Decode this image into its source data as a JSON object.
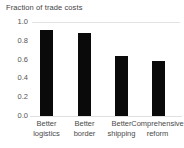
{
  "chart_data": {
    "type": "bar",
    "title": "Fraction of trade costs",
    "xlabel": "",
    "ylabel": "",
    "categories": [
      "Better logistics",
      "Better border",
      "Better shipping",
      "Comprehensive reform"
    ],
    "category_lines": [
      [
        "Better",
        "logistics"
      ],
      [
        "Better",
        "border"
      ],
      [
        "Better",
        "shipping"
      ],
      [
        "Comprehensive",
        "reform"
      ]
    ],
    "values": [
      0.92,
      0.88,
      0.64,
      0.58
    ],
    "ylim": [
      0.0,
      1.0
    ],
    "yticks": [
      "1.0",
      "0.8",
      "0.6",
      "0.4",
      "0.2",
      "0.0"
    ],
    "ytick_values": [
      1.0,
      0.8,
      0.6,
      0.4,
      0.2,
      0.0
    ],
    "grid": "top-only",
    "legend": "none",
    "bar_color": "#0a0a0a",
    "gridline_color": "#e3e3e3",
    "background_color": "#ffffff",
    "text_color": "#4a4a4a"
  }
}
